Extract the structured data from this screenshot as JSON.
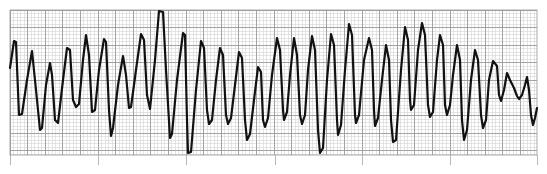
{
  "chart_data": {
    "type": "line",
    "title": "",
    "subtitle": "",
    "xlabel": "",
    "ylabel": "",
    "grid": true,
    "legend": null,
    "plot_area": {
      "x0": 10,
      "y0": 10,
      "x1": 537,
      "y1": 155
    },
    "grid_spec": {
      "minor_px": 3.52,
      "major_every": 5,
      "minor_color": "#d4d4d4",
      "major_color": "#9a9a9a"
    },
    "time_marks_x": [
      10,
      98,
      186,
      275,
      362,
      450,
      537
    ],
    "trace_color": "#111111",
    "trace_points": [
      [
        10,
        68
      ],
      [
        14,
        41
      ],
      [
        16,
        42
      ],
      [
        19,
        115
      ],
      [
        22,
        114
      ],
      [
        27,
        80
      ],
      [
        32,
        51
      ],
      [
        36,
        90
      ],
      [
        40,
        130
      ],
      [
        42,
        128
      ],
      [
        46,
        85
      ],
      [
        50,
        63
      ],
      [
        52,
        75
      ],
      [
        55,
        120
      ],
      [
        58,
        123
      ],
      [
        63,
        80
      ],
      [
        67,
        48
      ],
      [
        70,
        50
      ],
      [
        73,
        100
      ],
      [
        76,
        107
      ],
      [
        79,
        104
      ],
      [
        83,
        60
      ],
      [
        86,
        35
      ],
      [
        89,
        55
      ],
      [
        92,
        112
      ],
      [
        95,
        110
      ],
      [
        99,
        70
      ],
      [
        104,
        39
      ],
      [
        106,
        42
      ],
      [
        109,
        110
      ],
      [
        111,
        136
      ],
      [
        113,
        128
      ],
      [
        118,
        85
      ],
      [
        123,
        56
      ],
      [
        126,
        75
      ],
      [
        129,
        108
      ],
      [
        131,
        107
      ],
      [
        136,
        70
      ],
      [
        141,
        34
      ],
      [
        144,
        40
      ],
      [
        147,
        95
      ],
      [
        150,
        109
      ],
      [
        155,
        60
      ],
      [
        159,
        11
      ],
      [
        163,
        12
      ],
      [
        166,
        70
      ],
      [
        170,
        138
      ],
      [
        172,
        134
      ],
      [
        177,
        80
      ],
      [
        183,
        33
      ],
      [
        185,
        35
      ],
      [
        187,
        120
      ],
      [
        188,
        153
      ],
      [
        191,
        152
      ],
      [
        196,
        90
      ],
      [
        201,
        41
      ],
      [
        204,
        48
      ],
      [
        207,
        110
      ],
      [
        209,
        124
      ],
      [
        212,
        120
      ],
      [
        216,
        80
      ],
      [
        220,
        48
      ],
      [
        223,
        55
      ],
      [
        226,
        115
      ],
      [
        228,
        124
      ],
      [
        231,
        118
      ],
      [
        235,
        85
      ],
      [
        239,
        52
      ],
      [
        242,
        58
      ],
      [
        245,
        120
      ],
      [
        247,
        140
      ],
      [
        250,
        134
      ],
      [
        254,
        100
      ],
      [
        258,
        67
      ],
      [
        261,
        72
      ],
      [
        263,
        120
      ],
      [
        265,
        127
      ],
      [
        268,
        118
      ],
      [
        272,
        75
      ],
      [
        277,
        38
      ],
      [
        280,
        50
      ],
      [
        283,
        110
      ],
      [
        284,
        120
      ],
      [
        287,
        112
      ],
      [
        290,
        75
      ],
      [
        294,
        38
      ],
      [
        297,
        55
      ],
      [
        300,
        115
      ],
      [
        302,
        124
      ],
      [
        305,
        115
      ],
      [
        308,
        70
      ],
      [
        312,
        36
      ],
      [
        315,
        50
      ],
      [
        318,
        130
      ],
      [
        320,
        153
      ],
      [
        323,
        148
      ],
      [
        327,
        80
      ],
      [
        331,
        34
      ],
      [
        334,
        45
      ],
      [
        337,
        120
      ],
      [
        338,
        135
      ],
      [
        341,
        125
      ],
      [
        345,
        70
      ],
      [
        349,
        24
      ],
      [
        352,
        35
      ],
      [
        355,
        115
      ],
      [
        356,
        123
      ],
      [
        359,
        115
      ],
      [
        364,
        60
      ],
      [
        369,
        38
      ],
      [
        372,
        50
      ],
      [
        374,
        110
      ],
      [
        375,
        126
      ],
      [
        378,
        118
      ],
      [
        382,
        80
      ],
      [
        386,
        45
      ],
      [
        389,
        60
      ],
      [
        391,
        120
      ],
      [
        393,
        142
      ],
      [
        396,
        140
      ],
      [
        401,
        70
      ],
      [
        405,
        27
      ],
      [
        408,
        40
      ],
      [
        410,
        100
      ],
      [
        411,
        110
      ],
      [
        414,
        105
      ],
      [
        418,
        50
      ],
      [
        422,
        23
      ],
      [
        425,
        35
      ],
      [
        428,
        105
      ],
      [
        430,
        117
      ],
      [
        433,
        112
      ],
      [
        437,
        60
      ],
      [
        440,
        35
      ],
      [
        443,
        45
      ],
      [
        445,
        105
      ],
      [
        447,
        115
      ],
      [
        450,
        105
      ],
      [
        453,
        75
      ],
      [
        457,
        45
      ],
      [
        460,
        60
      ],
      [
        462,
        120
      ],
      [
        464,
        140
      ],
      [
        467,
        130
      ],
      [
        471,
        80
      ],
      [
        475,
        50
      ],
      [
        478,
        60
      ],
      [
        481,
        115
      ],
      [
        483,
        128
      ],
      [
        486,
        120
      ],
      [
        489,
        80
      ],
      [
        493,
        61
      ],
      [
        497,
        66
      ],
      [
        499,
        95
      ],
      [
        501,
        101
      ],
      [
        504,
        90
      ],
      [
        507,
        73
      ],
      [
        510,
        80
      ],
      [
        514,
        88
      ],
      [
        517,
        96
      ],
      [
        519,
        99
      ],
      [
        522,
        95
      ],
      [
        525,
        85
      ],
      [
        527,
        77
      ],
      [
        529,
        90
      ],
      [
        531,
        115
      ],
      [
        533,
        125
      ],
      [
        535,
        118
      ],
      [
        537,
        108
      ]
    ]
  }
}
